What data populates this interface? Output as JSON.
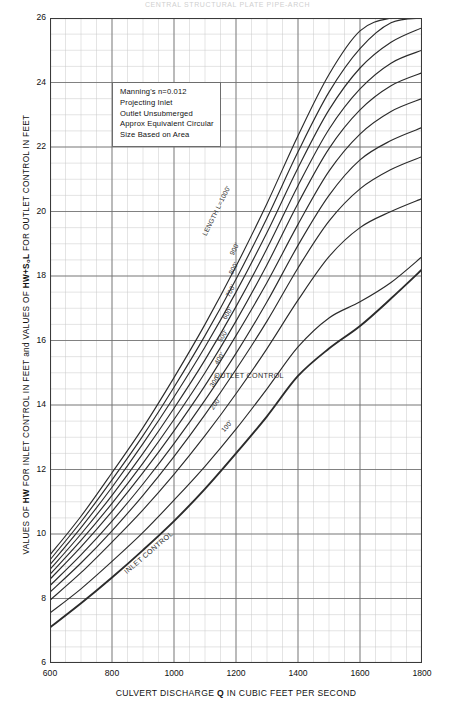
{
  "top_title": "CENTRAL STRUCTURAL PLATE PIPE-ARCH",
  "notes": {
    "title": "chart-notes",
    "lines": [
      "Manning's n=0.012",
      "Projecting Inlet",
      "Outlet Unsubmerged",
      "Approx Equivalent Circular",
      "Size Based on Area"
    ]
  },
  "annotations": {
    "outlet_control": "OUTLET CONTROL",
    "inlet_control": "INLET CONTROL",
    "length_lead": "LENGTH L=1000'"
  },
  "chart_data": {
    "type": "line",
    "title": "CENTRAL STRUCTURAL PLATE PIPE-ARCH",
    "xlabel": "CULVERT DISCHARGE Q IN CUBIC FEET PER SECOND",
    "ylabel": "VALUES OF HW FOR INLET CONTROL IN FEET and VALUES OF HW+S₀L FOR OUTLET CONTROL IN FEET",
    "xlim": [
      600,
      1800
    ],
    "ylim": [
      6,
      26
    ],
    "xticks": [
      600,
      800,
      1000,
      1200,
      1400,
      1600,
      1800
    ],
    "yticks": [
      6,
      8,
      10,
      12,
      14,
      16,
      18,
      20,
      22,
      24,
      26
    ],
    "grid": true,
    "minor_grid": true,
    "minor_x_step": 50,
    "minor_y_step": 0.5,
    "legend_position": "inline-curve-labels",
    "x": [
      600,
      700,
      800,
      900,
      1000,
      1100,
      1200,
      1300,
      1400,
      1500,
      1600,
      1700,
      1800
    ],
    "series": [
      {
        "name": "INLET CONTROL",
        "label": "INLET CONTROL",
        "emphasis": true,
        "values": [
          7.1,
          7.85,
          8.65,
          9.5,
          10.4,
          11.4,
          12.5,
          13.65,
          14.9,
          15.75,
          16.45,
          17.3,
          18.2
        ]
      },
      {
        "name": "LENGTH L=100'",
        "label": "100'",
        "emphasis": false,
        "values": [
          7.55,
          8.3,
          9.15,
          10.05,
          11.05,
          12.1,
          13.25,
          14.5,
          15.8,
          16.7,
          17.2,
          17.8,
          18.6
        ]
      },
      {
        "name": "LENGTH L=200'",
        "label": "200'",
        "emphasis": false,
        "values": [
          7.95,
          8.8,
          9.75,
          10.75,
          11.85,
          13.05,
          14.35,
          15.75,
          17.25,
          18.6,
          19.5,
          20.0,
          20.4
        ]
      },
      {
        "name": "LENGTH L=300'",
        "label": "300'",
        "emphasis": false,
        "values": [
          8.2,
          9.1,
          10.1,
          11.2,
          12.4,
          13.7,
          15.1,
          16.6,
          18.25,
          19.7,
          20.7,
          21.3,
          21.7
        ]
      },
      {
        "name": "LENGTH L=400'",
        "label": "400'",
        "emphasis": false,
        "values": [
          8.4,
          9.35,
          10.4,
          11.55,
          12.8,
          14.15,
          15.6,
          17.2,
          18.95,
          20.5,
          21.6,
          22.2,
          22.6
        ]
      },
      {
        "name": "LENGTH L=500'",
        "label": "500'",
        "emphasis": false,
        "values": [
          8.6,
          9.6,
          10.7,
          11.9,
          13.2,
          14.6,
          16.15,
          17.8,
          19.6,
          21.25,
          22.4,
          23.1,
          23.5
        ]
      },
      {
        "name": "LENGTH L=600'",
        "label": "600'",
        "emphasis": false,
        "values": [
          8.75,
          9.8,
          10.95,
          12.2,
          13.55,
          15.0,
          16.6,
          18.35,
          20.25,
          21.95,
          23.15,
          23.9,
          24.3
        ]
      },
      {
        "name": "LENGTH L=700'",
        "label": "700'",
        "emphasis": false,
        "values": [
          8.9,
          10.0,
          11.2,
          12.5,
          13.9,
          15.4,
          17.05,
          18.85,
          20.8,
          22.55,
          23.8,
          24.6,
          25.0
        ]
      },
      {
        "name": "LENGTH L=800'",
        "label": "800'",
        "emphasis": false,
        "values": [
          9.05,
          10.2,
          11.45,
          12.8,
          14.25,
          15.8,
          17.5,
          19.35,
          21.35,
          23.15,
          24.45,
          25.25,
          25.7
        ]
      },
      {
        "name": "LENGTH L=900'",
        "label": "900'",
        "emphasis": false,
        "values": [
          9.2,
          10.38,
          11.68,
          13.05,
          14.55,
          16.15,
          17.9,
          19.8,
          21.85,
          23.7,
          25.05,
          25.85,
          26.0
        ]
      },
      {
        "name": "LENGTH L=1000'",
        "label": "LENGTH L=1000'",
        "emphasis": false,
        "values": [
          9.35,
          10.55,
          11.9,
          13.3,
          14.85,
          16.5,
          18.3,
          20.25,
          22.35,
          24.25,
          25.6,
          26.0,
          26.0
        ]
      }
    ]
  }
}
